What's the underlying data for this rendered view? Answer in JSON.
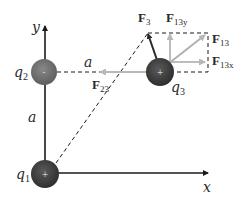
{
  "diagram": {
    "axes": {
      "x_label": "x",
      "y_label": "y"
    },
    "charges": [
      {
        "name": "q",
        "subscript": "1",
        "sign": "+",
        "color": "#3a3a3a"
      },
      {
        "name": "q",
        "subscript": "2",
        "sign": "-",
        "color": "#707070"
      },
      {
        "name": "q",
        "subscript": "3",
        "sign": "+",
        "color": "#3a3a3a"
      }
    ],
    "distances": {
      "vertical": "a",
      "horizontal": "a"
    },
    "forces": {
      "F23": {
        "main": "F",
        "sub": "23"
      },
      "F3": {
        "main": "F",
        "sub": "3"
      },
      "F13": {
        "main": "F",
        "sub": "13"
      },
      "F13y": {
        "main": "F",
        "sub": "13y"
      },
      "F13x": {
        "main": "F",
        "sub": "13x"
      }
    },
    "colors": {
      "axis": "#1a1a1a",
      "dashed": "#1a1a1a",
      "light_arrow": "#b8b8b8",
      "dark_arrow": "#2a2a2a"
    }
  }
}
